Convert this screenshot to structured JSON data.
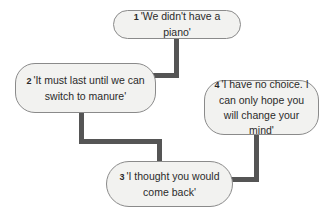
{
  "diagram": {
    "nodes": [
      {
        "id": 1,
        "number": "1",
        "text": "'We didn't have a piano'"
      },
      {
        "id": 2,
        "number": "2",
        "text": "'It must last until we can switch to manure'"
      },
      {
        "id": 3,
        "number": "3",
        "text": "'I thought you would come back'"
      },
      {
        "id": 4,
        "number": "4",
        "text": "'I have no choice. I can only hope you will change your mind'"
      }
    ],
    "edges": [
      {
        "from": 1,
        "to": 2
      },
      {
        "from": 2,
        "to": 3
      },
      {
        "from": 4,
        "to": 3
      }
    ],
    "colors": {
      "node_fill": "#f2f2f0",
      "node_border": "#8a8a8a",
      "connector": "#555555"
    }
  }
}
